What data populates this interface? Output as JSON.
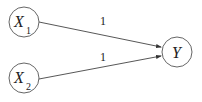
{
  "diagram": {
    "type": "directed-graph",
    "nodes": [
      {
        "id": "X1",
        "label": "X",
        "subscript": "1",
        "cx": 24,
        "cy": 22,
        "r": 15
      },
      {
        "id": "X2",
        "label": "X",
        "subscript": "2",
        "cx": 24,
        "cy": 78,
        "r": 15
      },
      {
        "id": "Y",
        "label": "Y",
        "subscript": "",
        "cx": 177,
        "cy": 52,
        "r": 15
      }
    ],
    "edges": [
      {
        "from": "X1",
        "to": "Y",
        "weight": "1"
      },
      {
        "from": "X2",
        "to": "Y",
        "weight": "1"
      }
    ],
    "colors": {
      "stroke": "#333333",
      "background": "#ffffff"
    }
  }
}
